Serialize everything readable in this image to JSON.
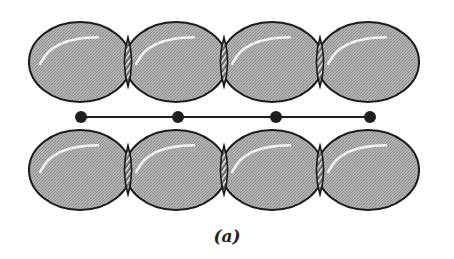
{
  "figure": {
    "caption": "(a)",
    "colors": {
      "sphere_fill": "#a9a9a9",
      "sphere_stroke": "#1a1a1a",
      "overlap_fill": "#7a7a7a",
      "highlight": "#f4f4f4",
      "node": "#1e1e1e",
      "bond_line": "#1e1e1e",
      "background": "#ffffff"
    },
    "rows": [
      {
        "name": "top-row",
        "cy": 62,
        "centers_x": [
          80,
          176,
          272,
          368
        ],
        "rx": 51,
        "ry": 40
      },
      {
        "name": "bottom-row",
        "cy": 170,
        "centers_x": [
          80,
          176,
          272,
          368
        ],
        "rx": 51,
        "ry": 40
      }
    ],
    "chain": {
      "y": 117,
      "nodes_x": [
        81,
        178,
        276,
        370
      ],
      "node_radius": 6
    }
  }
}
